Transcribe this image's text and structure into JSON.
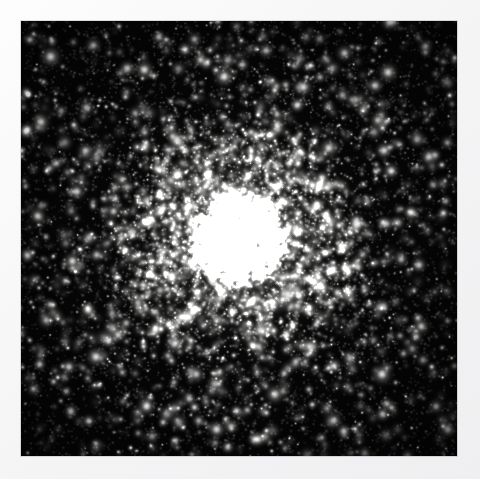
{
  "page": {
    "background_color": "#f7f7f8",
    "kind": "astronomical-photograph",
    "color_mode": "monochrome"
  },
  "plate": {
    "label": "globular-cluster-image",
    "x": 21,
    "y": 21,
    "width": 436,
    "height": 435,
    "background_color": "#000000",
    "border_color": "#f2f2f2"
  },
  "scene": {
    "object_type": "globular cluster",
    "center_x": 0.5,
    "center_y": 0.505,
    "core_radius": 0.105,
    "half_light_radius": 0.21,
    "halo_radius": 0.47,
    "core_color": "#e8e8e6",
    "halo_color": "#bdbdbb",
    "star_color": "#ffffff",
    "sky_color": "#050505"
  },
  "chart_data": {
    "type": "scatter",
    "xlabel": "",
    "ylabel": "",
    "xlim": [
      0,
      1
    ],
    "ylim": [
      0,
      1
    ],
    "grid": false,
    "legend": "none",
    "profile": {
      "model": "king",
      "center": [
        0.5,
        0.505
      ],
      "core_radius": 0.105,
      "tidal_radius": 0.62,
      "concentration": 1.8
    },
    "populations": [
      {
        "name": "core members",
        "count": 2600,
        "radius_scale": 0.115,
        "brightness_range": [
          0.35,
          1.0
        ],
        "size_range": [
          0.7,
          2.3
        ]
      },
      {
        "name": "halo members",
        "count": 2100,
        "radius_scale": 0.3,
        "brightness_range": [
          0.22,
          0.95
        ],
        "size_range": [
          0.8,
          3.0
        ]
      },
      {
        "name": "outer members",
        "count": 1500,
        "radius_scale": 0.56,
        "brightness_range": [
          0.15,
          0.85
        ],
        "size_range": [
          0.8,
          3.2
        ]
      },
      {
        "name": "field stars",
        "count": 1400,
        "radius_scale": 1.0,
        "brightness_range": [
          0.1,
          1.0
        ],
        "size_range": [
          0.7,
          3.6
        ]
      }
    ],
    "bright_stars": [
      {
        "x": 0.068,
        "y": 0.082,
        "mag": 0.96,
        "size": 3.3
      },
      {
        "x": 0.166,
        "y": 0.056,
        "mag": 0.72,
        "size": 2.6
      },
      {
        "x": 0.283,
        "y": 0.112,
        "mag": 0.88,
        "size": 3.0
      },
      {
        "x": 0.398,
        "y": 0.042,
        "mag": 0.64,
        "size": 2.4
      },
      {
        "x": 0.466,
        "y": 0.128,
        "mag": 0.91,
        "size": 3.1
      },
      {
        "x": 0.562,
        "y": 0.068,
        "mag": 0.7,
        "size": 2.5
      },
      {
        "x": 0.648,
        "y": 0.152,
        "mag": 0.86,
        "size": 2.9
      },
      {
        "x": 0.742,
        "y": 0.074,
        "mag": 0.78,
        "size": 2.7
      },
      {
        "x": 0.842,
        "y": 0.118,
        "mag": 0.92,
        "size": 3.1
      },
      {
        "x": 0.928,
        "y": 0.058,
        "mag": 0.66,
        "size": 2.4
      },
      {
        "x": 0.046,
        "y": 0.232,
        "mag": 0.84,
        "size": 2.9
      },
      {
        "x": 0.148,
        "y": 0.298,
        "mag": 0.74,
        "size": 2.6
      },
      {
        "x": 0.262,
        "y": 0.212,
        "mag": 0.62,
        "size": 2.3
      },
      {
        "x": 0.358,
        "y": 0.272,
        "mag": 0.8,
        "size": 2.8
      },
      {
        "x": 0.588,
        "y": 0.238,
        "mag": 0.76,
        "size": 2.7
      },
      {
        "x": 0.706,
        "y": 0.292,
        "mag": 0.88,
        "size": 3.0
      },
      {
        "x": 0.818,
        "y": 0.228,
        "mag": 0.7,
        "size": 2.5
      },
      {
        "x": 0.936,
        "y": 0.312,
        "mag": 0.82,
        "size": 2.8
      },
      {
        "x": 0.038,
        "y": 0.448,
        "mag": 0.78,
        "size": 2.7
      },
      {
        "x": 0.118,
        "y": 0.552,
        "mag": 0.86,
        "size": 2.9
      },
      {
        "x": 0.058,
        "y": 0.688,
        "mag": 0.72,
        "size": 2.6
      },
      {
        "x": 0.172,
        "y": 0.772,
        "mag": 0.9,
        "size": 3.1
      },
      {
        "x": 0.268,
        "y": 0.648,
        "mag": 0.68,
        "size": 2.4
      },
      {
        "x": 0.288,
        "y": 0.886,
        "mag": 0.84,
        "size": 2.9
      },
      {
        "x": 0.402,
        "y": 0.812,
        "mag": 0.76,
        "size": 2.7
      },
      {
        "x": 0.482,
        "y": 0.932,
        "mag": 0.7,
        "size": 2.5
      },
      {
        "x": 0.582,
        "y": 0.858,
        "mag": 0.88,
        "size": 3.0
      },
      {
        "x": 0.662,
        "y": 0.748,
        "mag": 0.8,
        "size": 2.8
      },
      {
        "x": 0.718,
        "y": 0.918,
        "mag": 0.74,
        "size": 2.6
      },
      {
        "x": 0.828,
        "y": 0.812,
        "mag": 0.92,
        "size": 3.2
      },
      {
        "x": 0.918,
        "y": 0.702,
        "mag": 0.78,
        "size": 2.7
      },
      {
        "x": 0.952,
        "y": 0.886,
        "mag": 0.66,
        "size": 2.4
      },
      {
        "x": 0.612,
        "y": 0.628,
        "mag": 0.94,
        "size": 3.2
      },
      {
        "x": 0.548,
        "y": 0.712,
        "mag": 0.82,
        "size": 2.8
      },
      {
        "x": 0.448,
        "y": 0.688,
        "mag": 0.72,
        "size": 2.5
      },
      {
        "x": 0.352,
        "y": 0.742,
        "mag": 0.86,
        "size": 2.9
      },
      {
        "x": 0.768,
        "y": 0.468,
        "mag": 0.74,
        "size": 2.6
      },
      {
        "x": 0.872,
        "y": 0.548,
        "mag": 0.68,
        "size": 2.4
      },
      {
        "x": 0.212,
        "y": 0.438,
        "mag": 0.7,
        "size": 2.5
      },
      {
        "x": 0.128,
        "y": 0.392,
        "mag": 0.8,
        "size": 2.8
      }
    ]
  }
}
